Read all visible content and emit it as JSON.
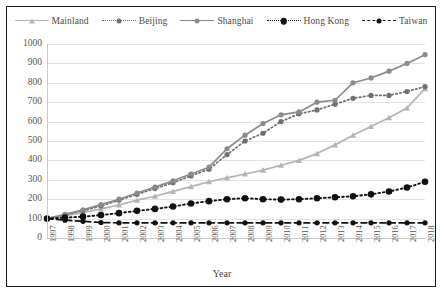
{
  "chart_data": {
    "type": "line",
    "title": "",
    "xlabel": "Year",
    "ylabel": "",
    "ylim": [
      0,
      1000
    ],
    "ytick_step": 100,
    "yticks": [
      "1000",
      "900",
      "800",
      "700",
      "600",
      "500",
      "400",
      "300",
      "200",
      "100",
      "0"
    ],
    "grid": true,
    "legend_position": "top",
    "categories": [
      "1997",
      "1998",
      "1999",
      "2000",
      "2001",
      "2002",
      "2003",
      "2004",
      "2005",
      "2006",
      "2007",
      "2008",
      "2009",
      "2010",
      "2011",
      "2012",
      "2013",
      "2014",
      "2015",
      "2016",
      "2017",
      "2018"
    ],
    "series": [
      {
        "name": "Mainland",
        "color": "#b3b3b3",
        "marker": "triangle",
        "line_style": "solid",
        "values": [
          100,
          115,
          130,
          150,
          170,
          195,
          215,
          240,
          265,
          290,
          310,
          330,
          350,
          375,
          400,
          435,
          480,
          530,
          575,
          620,
          670,
          770
        ]
      },
      {
        "name": "Beijing",
        "color": "#6f6f6f",
        "marker": "circle",
        "line_style": "dotted",
        "values": [
          100,
          120,
          140,
          165,
          195,
          225,
          255,
          285,
          320,
          355,
          430,
          500,
          540,
          600,
          640,
          660,
          690,
          720,
          735,
          735,
          755,
          780
        ]
      },
      {
        "name": "Shanghai",
        "color": "#8a8a8a",
        "marker": "circle",
        "line_style": "solid",
        "values": [
          100,
          122,
          145,
          172,
          200,
          232,
          262,
          295,
          330,
          365,
          460,
          530,
          590,
          635,
          650,
          700,
          710,
          800,
          825,
          860,
          900,
          945
        ]
      },
      {
        "name": "Hong Kong",
        "color": "#111111",
        "marker": "circle-large",
        "line_style": "dotted",
        "values": [
          100,
          105,
          110,
          118,
          128,
          140,
          150,
          162,
          178,
          190,
          200,
          205,
          200,
          198,
          200,
          205,
          210,
          215,
          225,
          240,
          260,
          290
        ]
      },
      {
        "name": "Taiwan",
        "color": "#111111",
        "marker": "circle",
        "line_style": "dashed",
        "values": [
          100,
          92,
          86,
          80,
          78,
          78,
          78,
          78,
          78,
          78,
          78,
          78,
          78,
          78,
          78,
          78,
          78,
          78,
          78,
          78,
          78,
          78
        ]
      }
    ]
  },
  "axis": {
    "x_title": "Year"
  },
  "caption": {
    "text": ""
  }
}
